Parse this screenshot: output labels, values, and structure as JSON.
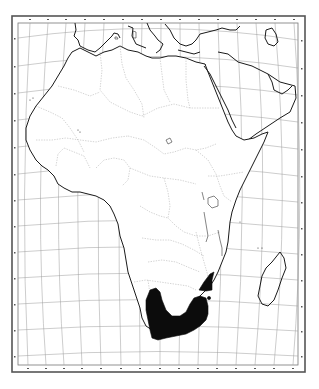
{
  "map": {
    "subject": "Africa outline map",
    "style": "black-and-white line map with graticule",
    "frame": {
      "outer": [
        12,
        16,
        305,
        372
      ],
      "inner": [
        18,
        23,
        298,
        365
      ]
    },
    "colors": {
      "background": "#ffffff",
      "coastline": "#1a1a1a",
      "graticule": "#9a9a9a",
      "borders": "#a8a8a8",
      "range_fill": "#0c0c0c"
    },
    "graticule": {
      "top_ticks": [
        "20°",
        "15°",
        "10°",
        "5°",
        "0°",
        "5°",
        "10°",
        "15°",
        "20°",
        "25°",
        "30°",
        "35°",
        "40°",
        "45°",
        "50°"
      ],
      "bottom_ticks": [
        "20°",
        "15°",
        "10°",
        "5°",
        "0°",
        "5°",
        "10°",
        "15°",
        "20°",
        "25°",
        "30°",
        "35°",
        "40°",
        "45°",
        "50°"
      ],
      "left_ticks": [
        "40°",
        "35°",
        "30°",
        "25°",
        "20°",
        "15°",
        "10°",
        "5°",
        "0°",
        "5°",
        "10°",
        "15°",
        "20°",
        "25°",
        "30°",
        "35°"
      ],
      "right_ticks": [
        "40°",
        "35°",
        "30°",
        "25°",
        "20°",
        "15°",
        "10°",
        "5°",
        "0°",
        "5°",
        "10°",
        "15°",
        "20°",
        "25°",
        "30°",
        "35°"
      ]
    },
    "features": {
      "distribution_range": "Southern and eastern coastal South Africa (Western Cape to KwaZulu-Natal)",
      "secondary_range": "Isolated patch in northeastern South Africa / Zimbabwe border region",
      "outlier_point": "Small isolated dot east of main secondary patch"
    }
  }
}
